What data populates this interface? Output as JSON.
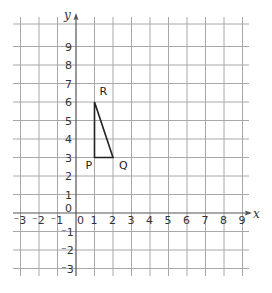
{
  "diagram": {
    "type": "coordinate-grid",
    "axes": {
      "x_label": "x",
      "y_label": "y",
      "x_range": [
        -3,
        9
      ],
      "y_range": [
        -3,
        9
      ],
      "x_ticks": [
        "-3",
        "-2",
        "-1",
        "0",
        "1",
        "2",
        "3",
        "4",
        "5",
        "6",
        "7",
        "8",
        "9"
      ],
      "y_ticks": [
        "9",
        "8",
        "7",
        "6",
        "5",
        "4",
        "3",
        "2",
        "1",
        "0",
        "-1",
        "-2",
        "-3"
      ]
    },
    "triangle": {
      "vertices": [
        {
          "label": "P",
          "x": 1,
          "y": 3
        },
        {
          "label": "Q",
          "x": 2,
          "y": 3
        },
        {
          "label": "R",
          "x": 1,
          "y": 6
        }
      ]
    },
    "colors": {
      "grid": "#a8a8a8",
      "axis": "#555555",
      "shape": "#222222",
      "text": "#333333"
    }
  }
}
